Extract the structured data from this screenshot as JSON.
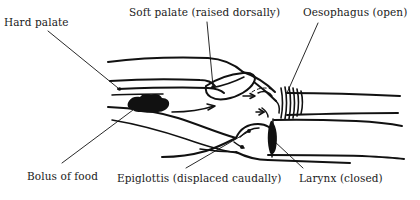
{
  "figure": {
    "background_color": "#ffffff",
    "ink_color": "#111111",
    "labels": [
      {
        "id": "hard-palate",
        "text": "Hard palate"
      },
      {
        "id": "soft-palate",
        "text": "Soft palate (raised dorsally)"
      },
      {
        "id": "oesophagus",
        "text": "Oesophagus (open)"
      },
      {
        "id": "bolus",
        "text": "Bolus of food"
      },
      {
        "id": "epiglottis",
        "text": "Epiglottis (displaced caudally)"
      },
      {
        "id": "larynx",
        "text": "Larynx (closed)"
      }
    ]
  }
}
